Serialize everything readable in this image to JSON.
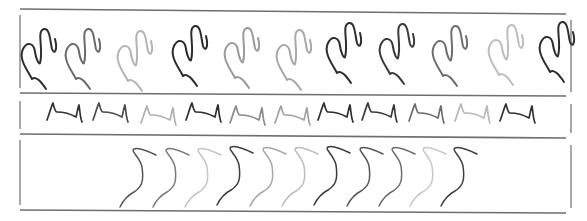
{
  "figure": {
    "panels": [
      {
        "name": "scribble-panel",
        "glyph": "w-scribble",
        "count": 11,
        "shades": [
          "#2e2e2e",
          "#6a6a6a",
          "#b4b4b4",
          "#2a2a2a",
          "#9a9a9a",
          "#a8a8a8",
          "#2c2c2c",
          "#3a3a3a",
          "#6e6e6e",
          "#bdbdbd",
          "#2e2e2e"
        ]
      },
      {
        "name": "waveform-panel",
        "glyph": "pulse-wave",
        "count": 11,
        "shades": [
          "#333333",
          "#4c4c4c",
          "#b0b0b0",
          "#2e2e2e",
          "#8a8a8a",
          "#a2a2a2",
          "#2e2e2e",
          "#3a3a3a",
          "#6c6c6c",
          "#b8b8b8",
          "#333333"
        ]
      },
      {
        "name": "s-curve-panel",
        "glyph": "s-curve",
        "count": 11,
        "shades": [
          "#555555",
          "#7a7a7a",
          "#c4c4c4",
          "#3c3c3c",
          "#a6a6a6",
          "#bcbcbc",
          "#3a3a3a",
          "#555555",
          "#6c6c6c",
          "#c8c8c8",
          "#3e3e3e"
        ]
      }
    ]
  }
}
